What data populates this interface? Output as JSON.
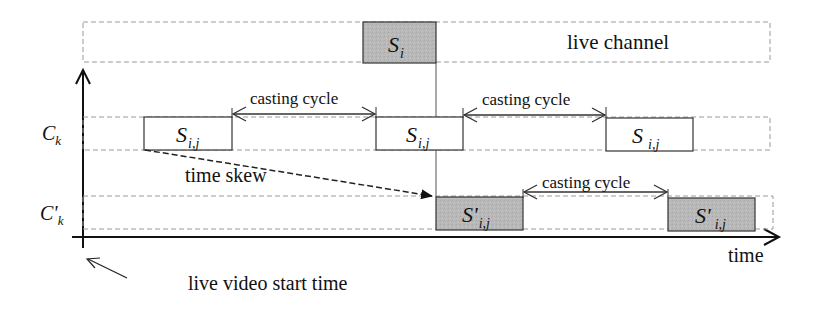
{
  "diagram": {
    "type": "timing-diagram",
    "colors": {
      "line": "#111111",
      "dashed": "#9a9a9a",
      "gray_fill": "#b8b8b8",
      "background": "#ffffff"
    },
    "labels": {
      "live_channel": "live channel",
      "time_axis": "time",
      "time_skew": "time skew",
      "live_start": "live video start time",
      "ck_base": "C",
      "ck_sub": "k",
      "cpk_base": "C'",
      "cpk_sub": "k"
    },
    "live_segment": {
      "base": "S",
      "sub": "i"
    },
    "ck_segments": [
      {
        "base": "S",
        "sub": "i,j"
      },
      {
        "base": "S",
        "sub": "i,j"
      },
      {
        "base": "S",
        "sub": "i,j"
      }
    ],
    "cpk_segments": [
      {
        "base": "S'",
        "sub": "i,j"
      },
      {
        "base": "S'",
        "sub": "i,j"
      }
    ],
    "casting_cycles": [
      {
        "label": "casting cycle"
      },
      {
        "label": "casting cycle"
      },
      {
        "label": "casting cycle"
      }
    ]
  }
}
